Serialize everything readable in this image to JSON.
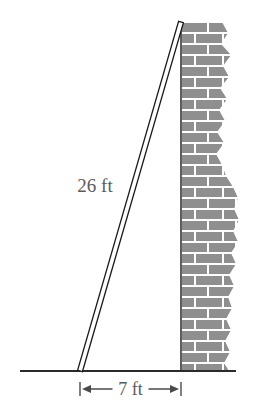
{
  "figure": {
    "labels": {
      "ladder_length": "26 ft",
      "base_distance": "7 ft"
    },
    "colors": {
      "line": "#1a1a1a",
      "brick_fill": "#8f8f8f",
      "mortar": "#ffffff",
      "text": "#5a5a5a",
      "ground": "#2b2b2b"
    },
    "geometry": {
      "ground_line": {
        "x1": 20,
        "y1": 371,
        "x2": 236,
        "y2": 371
      },
      "ladder": {
        "foot_x": 80,
        "foot_y": 371,
        "top_x": 181,
        "top_y": 22,
        "thickness": 5
      },
      "wall": {
        "left_x": 181,
        "top_y": 22,
        "bottom_y": 371,
        "max_right_x": 240
      },
      "dimension": {
        "y": 389,
        "x_start": 80,
        "x_end": 181,
        "tick_height": 14
      }
    },
    "brick": {
      "row_height": 11,
      "brick_width": 26,
      "mortar_width": 2,
      "rows": 32
    },
    "wall_edge_profile": [
      {
        "y": 22,
        "x": 222
      },
      {
        "y": 33,
        "x": 228
      },
      {
        "y": 44,
        "x": 221
      },
      {
        "y": 55,
        "x": 231
      },
      {
        "y": 66,
        "x": 223
      },
      {
        "y": 77,
        "x": 229
      },
      {
        "y": 88,
        "x": 220
      },
      {
        "y": 99,
        "x": 227
      },
      {
        "y": 110,
        "x": 219
      },
      {
        "y": 121,
        "x": 225
      },
      {
        "y": 132,
        "x": 217
      },
      {
        "y": 143,
        "x": 224
      },
      {
        "y": 154,
        "x": 216
      },
      {
        "y": 165,
        "x": 222
      },
      {
        "y": 176,
        "x": 226
      },
      {
        "y": 187,
        "x": 233
      },
      {
        "y": 198,
        "x": 238
      },
      {
        "y": 209,
        "x": 234
      },
      {
        "y": 220,
        "x": 239
      },
      {
        "y": 231,
        "x": 233
      },
      {
        "y": 242,
        "x": 238
      },
      {
        "y": 253,
        "x": 231
      },
      {
        "y": 264,
        "x": 236
      },
      {
        "y": 275,
        "x": 229
      },
      {
        "y": 286,
        "x": 234
      },
      {
        "y": 297,
        "x": 228
      },
      {
        "y": 308,
        "x": 232
      },
      {
        "y": 319,
        "x": 226
      },
      {
        "y": 330,
        "x": 231
      },
      {
        "y": 341,
        "x": 225
      },
      {
        "y": 352,
        "x": 230
      },
      {
        "y": 363,
        "x": 224
      },
      {
        "y": 371,
        "x": 229
      }
    ]
  }
}
